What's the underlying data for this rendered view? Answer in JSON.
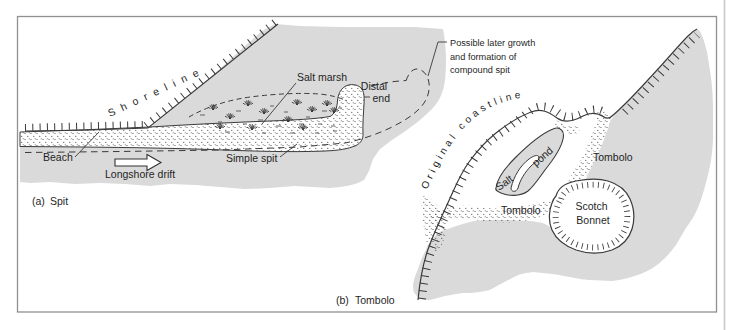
{
  "colors": {
    "sea_gray": "#dadada",
    "line_ink": "#3a3a3a",
    "text_ink": "#1f1f1f",
    "frame_gray": "#909090",
    "page_edge_gray": "#c9c9c9"
  },
  "panel_a": {
    "caption": {
      "marker": "(a)",
      "title": "Spit"
    },
    "shoreline_label": "Shoreline",
    "salt_marsh_label": "Salt marsh",
    "distal_end": {
      "line1": "Distal",
      "line2": "end"
    },
    "beach_label": "Beach",
    "simple_spit_label": "Simple spit",
    "longshore_drift_label": "Longshore drift",
    "compound_note": {
      "line1": "Possible later growth",
      "line2": "and formation of",
      "line3": "compound spit"
    }
  },
  "panel_b": {
    "caption": {
      "marker": "(b)",
      "title": "Tombolo"
    },
    "original_coastline_label": "Original coastline",
    "salt_pond": {
      "word1": "Salt",
      "word2": "pond"
    },
    "tombolo_label_right": "Tombolo",
    "tombolo_label_bottom": "Tombolo",
    "island": {
      "line1": "Scotch",
      "line2": "Bonnet"
    }
  }
}
